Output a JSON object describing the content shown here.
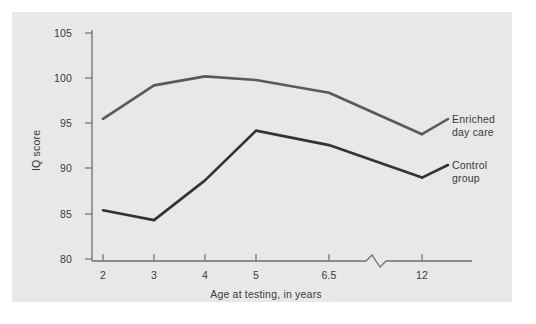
{
  "chart_data": {
    "type": "line",
    "title": "",
    "xlabel": "Age at testing, in years",
    "ylabel": "IQ score",
    "categories": [
      "2",
      "3",
      "4",
      "5",
      "6.5",
      "12"
    ],
    "x_tick_labels": [
      "2",
      "3",
      "4",
      "5",
      "6.5",
      "12"
    ],
    "y_tick_labels": [
      "105",
      "100",
      "95",
      "90",
      "85",
      "80"
    ],
    "y_ticks": [
      105,
      100,
      95,
      90,
      85,
      80
    ],
    "ylim": [
      80,
      105
    ],
    "grid": false,
    "legend_position": "right-inline",
    "axis_break": {
      "axis": "x",
      "between": [
        "6.5",
        "12"
      ],
      "style": "zigzag"
    },
    "series": [
      {
        "name": "Enriched day care",
        "label_lines": [
          "Enriched",
          "day care"
        ],
        "color": "#5a5a5a",
        "values": [
          95.5,
          99.2,
          100.2,
          99.8,
          98.4,
          93.8
        ]
      },
      {
        "name": "Control group",
        "label_lines": [
          "Control",
          "group"
        ],
        "color": "#333333",
        "values": [
          85.4,
          84.3,
          88.7,
          94.2,
          92.6,
          89.0
        ]
      }
    ],
    "colors": {
      "panel_background": "#e8e8e8",
      "page_background": "#ffffff",
      "axis": "#6e6e6e",
      "text": "#3a3a3a"
    }
  }
}
